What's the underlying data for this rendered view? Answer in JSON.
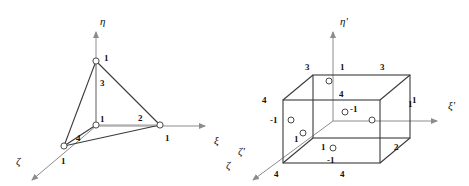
{
  "figure": {
    "title": "",
    "colors": {
      "edge": "#3a3a3a",
      "axis": "#8c8c8c",
      "node_stroke": "#4a4a4a",
      "node_fill": "#ffffff",
      "text": "#111111",
      "background": "#ffffff"
    }
  },
  "left_diagram": {
    "name": "tetrahedron-natural-coordinates",
    "axes": [
      {
        "id": "eta",
        "label": "η",
        "x": 100,
        "y": 16,
        "direction": "up"
      },
      {
        "id": "xi",
        "label": "ξ",
        "x": 214,
        "y": 135,
        "direction": "right"
      },
      {
        "id": "zeta",
        "label": "ζ",
        "x": 16,
        "y": 156,
        "direction": "down-left"
      },
      {
        "id": "zeta_stray",
        "label": "ζ",
        "x": 226,
        "y": 160,
        "direction": "none"
      }
    ],
    "nodes": [
      {
        "id": "n3",
        "node_label": "3",
        "value_label": "1",
        "cx": 96,
        "cy": 61
      },
      {
        "id": "n1",
        "node_label": "1",
        "value_label": "",
        "cx": 96,
        "cy": 125
      },
      {
        "id": "n2",
        "node_label": "2",
        "value_label": "1",
        "cx": 160,
        "cy": 125
      },
      {
        "id": "n4",
        "node_label": "4",
        "value_label": "1",
        "cx": 64,
        "cy": 146
      }
    ],
    "node_numbers": [
      {
        "text": "3",
        "x": 100,
        "y": 79
      },
      {
        "text": "1",
        "x": 100,
        "y": 115
      },
      {
        "text": "2",
        "x": 138,
        "y": 114
      },
      {
        "text": "4",
        "x": 76,
        "y": 134
      }
    ],
    "value_numbers": [
      {
        "text": "1",
        "x": 104,
        "y": 54
      },
      {
        "text": "1",
        "x": 165,
        "y": 134
      },
      {
        "text": "1",
        "x": 61,
        "y": 157
      }
    ]
  },
  "right_diagram": {
    "name": "hexahedron-mapped-coordinates",
    "axes": [
      {
        "id": "eta_prime",
        "label": "η'",
        "x": 340,
        "y": 16,
        "direction": "up"
      },
      {
        "id": "xi_prime",
        "label": "ξ'",
        "x": 448,
        "y": 100,
        "direction": "right"
      },
      {
        "id": "zeta_prime",
        "label": "ζ'",
        "x": 238,
        "y": 146,
        "direction": "down-left"
      }
    ],
    "corner_numbers": [
      {
        "text": "3",
        "x": 305,
        "y": 63
      },
      {
        "text": "1",
        "x": 340,
        "y": 63
      },
      {
        "text": "3",
        "x": 380,
        "y": 63
      },
      {
        "text": "4",
        "x": 262,
        "y": 96
      },
      {
        "text": "4",
        "x": 339,
        "y": 90
      },
      {
        "text": "1",
        "x": 412,
        "y": 96
      },
      {
        "text": "1",
        "x": 294,
        "y": 135
      },
      {
        "text": "1",
        "x": 321,
        "y": 143
      },
      {
        "text": "2",
        "x": 394,
        "y": 143
      },
      {
        "text": "4",
        "x": 274,
        "y": 170
      },
      {
        "text": "4",
        "x": 340,
        "y": 170
      }
    ],
    "value_numbers": [
      {
        "text": "-1",
        "x": 350,
        "y": 105
      },
      {
        "text": "-1",
        "x": 274,
        "y": 116
      },
      {
        "text": "1",
        "x": 408,
        "y": 100
      },
      {
        "text": "-1",
        "x": 327,
        "y": 156
      }
    ],
    "nodes": [
      {
        "id": "top-face-center",
        "cx": 329,
        "cy": 81
      },
      {
        "id": "back-right-mid",
        "cx": 345,
        "cy": 112
      },
      {
        "id": "left-mid",
        "cx": 291,
        "cy": 120
      },
      {
        "id": "right-mid",
        "cx": 372,
        "cy": 120
      },
      {
        "id": "front-left-corner",
        "cx": 303,
        "cy": 133
      },
      {
        "id": "bottom-face-center",
        "cx": 333,
        "cy": 148
      }
    ]
  }
}
